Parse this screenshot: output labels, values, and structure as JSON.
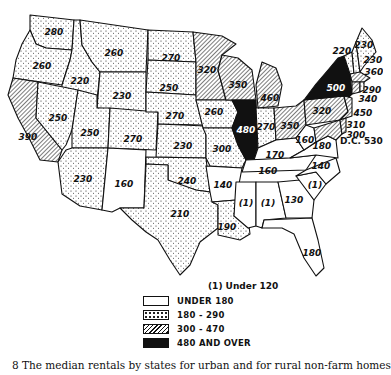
{
  "map": {
    "title": "Median rentals by states",
    "footnote": "(1) Under 120",
    "dc_label": "D.C. 530",
    "states": [
      {
        "id": "WA",
        "value": "280",
        "category": "180-290"
      },
      {
        "id": "OR",
        "value": "260",
        "category": "180-290"
      },
      {
        "id": "CA",
        "value": "390",
        "category": "300-470"
      },
      {
        "id": "ID",
        "value": "220",
        "category": "180-290"
      },
      {
        "id": "NV",
        "value": "250",
        "category": "180-290"
      },
      {
        "id": "MT",
        "value": "260",
        "category": "180-290"
      },
      {
        "id": "WY",
        "value": "230",
        "category": "180-290"
      },
      {
        "id": "UT",
        "value": "250",
        "category": "180-290"
      },
      {
        "id": "AZ",
        "value": "230",
        "category": "180-290"
      },
      {
        "id": "CO",
        "value": "270",
        "category": "180-290"
      },
      {
        "id": "NM",
        "value": "160",
        "category": "under-180"
      },
      {
        "id": "ND",
        "value": "270",
        "category": "180-290"
      },
      {
        "id": "SD",
        "value": "250",
        "category": "180-290"
      },
      {
        "id": "NE",
        "value": "270",
        "category": "180-290"
      },
      {
        "id": "KS",
        "value": "230",
        "category": "180-290"
      },
      {
        "id": "OK",
        "value": "240",
        "category": "180-290"
      },
      {
        "id": "TX",
        "value": "210",
        "category": "180-290"
      },
      {
        "id": "MN",
        "value": "320",
        "category": "300-470"
      },
      {
        "id": "IA",
        "value": "260",
        "category": "180-290"
      },
      {
        "id": "MO",
        "value": "300",
        "category": "300-470"
      },
      {
        "id": "AR",
        "value": "140",
        "category": "under-180"
      },
      {
        "id": "LA",
        "value": "190",
        "category": "180-290"
      },
      {
        "id": "WI",
        "value": "350",
        "category": "300-470"
      },
      {
        "id": "IL",
        "value": "480",
        "category": "480+"
      },
      {
        "id": "MI",
        "value": "460",
        "category": "300-470"
      },
      {
        "id": "IN",
        "value": "270",
        "category": "180-290"
      },
      {
        "id": "OH",
        "value": "350",
        "category": "300-470"
      },
      {
        "id": "KY",
        "value": "170",
        "category": "under-180"
      },
      {
        "id": "TN",
        "value": "160",
        "category": "under-180"
      },
      {
        "id": "MS",
        "value": "(1)",
        "category": "under-180"
      },
      {
        "id": "AL",
        "value": "(1)",
        "category": "under-180"
      },
      {
        "id": "GA",
        "value": "130",
        "category": "under-180"
      },
      {
        "id": "FL",
        "value": "180",
        "category": "under-180"
      },
      {
        "id": "SC",
        "value": "(1)",
        "category": "under-180"
      },
      {
        "id": "NC",
        "value": "140",
        "category": "under-180"
      },
      {
        "id": "VA",
        "value": "180",
        "category": "under-180"
      },
      {
        "id": "WV",
        "value": "160",
        "category": "under-180"
      },
      {
        "id": "PA",
        "value": "320",
        "category": "300-470"
      },
      {
        "id": "NY",
        "value": "500",
        "category": "480+"
      },
      {
        "id": "VT",
        "value": "220",
        "category": "180-290"
      },
      {
        "id": "NH",
        "value": "230",
        "category": "180-290"
      },
      {
        "id": "ME",
        "value": "230",
        "category": "180-290"
      },
      {
        "id": "MA",
        "value": "360",
        "category": "300-470"
      },
      {
        "id": "RI",
        "value": "290",
        "category": "180-290"
      },
      {
        "id": "CT",
        "value": "340",
        "category": "300-470"
      },
      {
        "id": "NJ",
        "value": "450",
        "category": "300-470"
      },
      {
        "id": "DE",
        "value": "310",
        "category": "300-470"
      },
      {
        "id": "MD",
        "value": "300",
        "category": "300-470"
      }
    ]
  },
  "legend": {
    "items": [
      {
        "label": "UNDER 180",
        "pattern": "blank"
      },
      {
        "label": "180 - 290",
        "pattern": "stipple"
      },
      {
        "label": "300 - 470",
        "pattern": "hatch"
      },
      {
        "label": "480 AND OVER",
        "pattern": "solid"
      }
    ]
  },
  "caption": "8 The median rentals by states for urban and for rural non-farm homes"
}
